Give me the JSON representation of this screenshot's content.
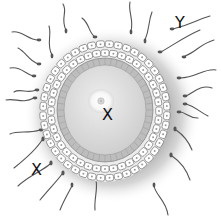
{
  "diagram": {
    "labels": [
      {
        "id": "Y",
        "text": "Y",
        "x": 175,
        "y": 15,
        "points_to": "sperm"
      },
      {
        "id": "X-center",
        "text": "X",
        "x": 102,
        "y": 107,
        "points_to": "oocyte"
      },
      {
        "id": "X-lower-left",
        "text": "X",
        "x": 31,
        "y": 162,
        "points_to": "corona region"
      }
    ],
    "colors": {
      "cytoplasm": "#d8d8d8",
      "zona": "#bdbdbd",
      "follicle_cell": "#ffffff",
      "cell_outline": "#777777",
      "halo": "#9a9a9a",
      "sperm": "#555555",
      "nucleus": "#f4f4f4"
    }
  }
}
